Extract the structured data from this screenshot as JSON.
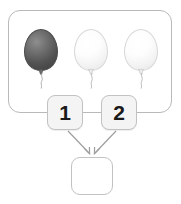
{
  "scene": {
    "title": "balloon counting addition task",
    "background_color": "#ffffff"
  },
  "balloon_frame": {
    "name": "balloon-group-frame",
    "border_color": "#b9b9b9",
    "balloons": [
      {
        "index": 1,
        "shade": "dark",
        "color": "#5a5a5a",
        "label": "dark gray balloon"
      },
      {
        "index": 2,
        "shade": "light",
        "color": "#f5f5f5",
        "label": "white balloon"
      },
      {
        "index": 3,
        "shade": "light",
        "color": "#f5f5f5",
        "label": "white balloon"
      }
    ],
    "balloon_count": 3
  },
  "tiles": [
    {
      "id": "tile-1",
      "value": "1",
      "background": "#f4f4f4",
      "border": "#c2c2c2"
    },
    {
      "id": "tile-2",
      "value": "2",
      "background": "#f4f4f4",
      "border": "#c2c2c2"
    }
  ],
  "answer_box": {
    "value": "",
    "placeholder": "",
    "background": "#ffffff",
    "border": "#c2c2c2"
  },
  "arrows": [
    {
      "from": "tile-1",
      "to": "answer-box",
      "color": "#9e9e9e"
    },
    {
      "from": "tile-2",
      "to": "answer-box",
      "color": "#9e9e9e"
    }
  ]
}
